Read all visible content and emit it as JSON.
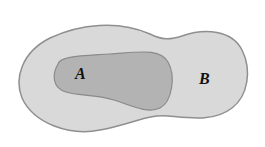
{
  "diagram": {
    "type": "set-inclusion",
    "sets": [
      {
        "id": "B",
        "label": "B",
        "fill": "#d9d9d9",
        "stroke": "#8f8f8f"
      },
      {
        "id": "A",
        "label": "A",
        "fill": "#b3b3b3",
        "stroke": "#8a8a8a",
        "subset_of": "B"
      }
    ],
    "background": "#ffffff"
  }
}
